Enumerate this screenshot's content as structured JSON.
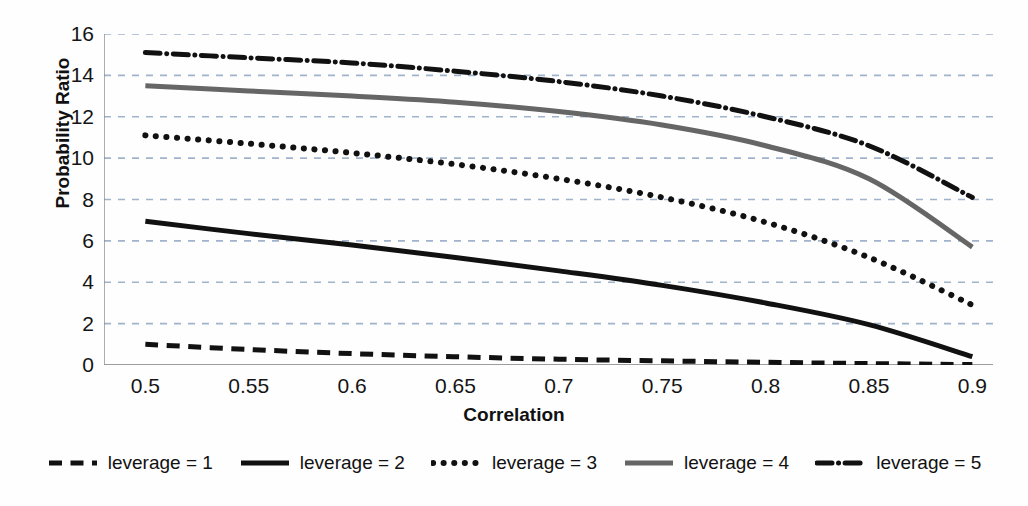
{
  "chart_data": {
    "type": "line",
    "title": "",
    "xlabel": "Correlation",
    "ylabel": "Probability Ratio",
    "xlim": [
      0.48,
      0.91
    ],
    "ylim": [
      0,
      16
    ],
    "xticks": [
      "0.5",
      "0.55",
      "0.6",
      "0.65",
      "0.7",
      "0.75",
      "0.8",
      "0.85",
      "0.9"
    ],
    "yticks": [
      "0",
      "2",
      "4",
      "6",
      "8",
      "10",
      "12",
      "14",
      "16"
    ],
    "grid": "horizontal-dashed",
    "legend_position": "bottom-center",
    "x": [
      0.5,
      0.55,
      0.6,
      0.65,
      0.7,
      0.75,
      0.8,
      0.85,
      0.9
    ],
    "series": [
      {
        "name": "leverage = 1",
        "style": "dashed",
        "color": "#111111",
        "width": 5,
        "values": [
          1.0,
          0.75,
          0.55,
          0.4,
          0.28,
          0.2,
          0.13,
          0.07,
          0.02
        ]
      },
      {
        "name": "leverage = 2",
        "style": "solid",
        "color": "#111111",
        "width": 5,
        "values": [
          6.95,
          6.35,
          5.8,
          5.2,
          4.55,
          3.85,
          3.0,
          1.95,
          0.4
        ]
      },
      {
        "name": "leverage = 3",
        "style": "dotted",
        "color": "#111111",
        "width": 6,
        "values": [
          11.1,
          10.7,
          10.25,
          9.7,
          9.0,
          8.1,
          6.9,
          5.2,
          2.9
        ]
      },
      {
        "name": "leverage = 4",
        "style": "solid-gray",
        "color": "#666666",
        "width": 5,
        "values": [
          13.5,
          13.25,
          13.0,
          12.7,
          12.25,
          11.6,
          10.6,
          9.0,
          5.7
        ]
      },
      {
        "name": "leverage = 5",
        "style": "dash-dot",
        "color": "#111111",
        "width": 5,
        "values": [
          15.1,
          14.85,
          14.6,
          14.2,
          13.7,
          13.0,
          12.0,
          10.6,
          8.1
        ]
      }
    ]
  }
}
